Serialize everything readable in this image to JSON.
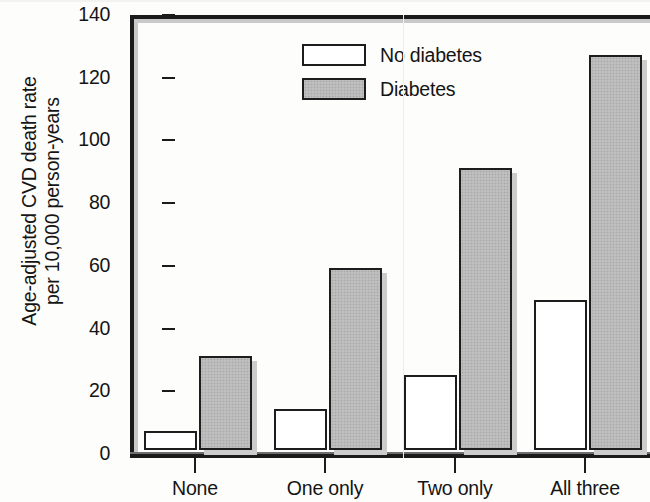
{
  "chart_data": {
    "type": "bar",
    "title": "",
    "xlabel": "",
    "ylabel_line1": "Age-adjusted CVD death rate",
    "ylabel_line2": "per 10,000 person-years",
    "categories": [
      "None",
      "One only",
      "Two only",
      "All three"
    ],
    "series": [
      {
        "name": "No diabetes",
        "values": [
          6,
          13,
          24,
          48
        ],
        "style": "open-white"
      },
      {
        "name": "Diabetes",
        "values": [
          30,
          58,
          90,
          126
        ],
        "style": "gray-stippled"
      }
    ],
    "ylim": [
      0,
      140
    ],
    "ytick_labels": [
      "0",
      "20",
      "40",
      "60",
      "80",
      "100",
      "120",
      "140"
    ],
    "ytick_values": [
      0,
      20,
      40,
      60,
      80,
      100,
      120,
      140
    ],
    "grid": false,
    "legend_position": "top-left-inside",
    "colors": {
      "no_diabetes_fill": "#ffffff",
      "diabetes_fill": "#b9b9b9",
      "outline": "#1d1d1d",
      "shadow": "#cccccc",
      "text": "#141414"
    }
  },
  "legend": {
    "entries": [
      {
        "label": "No diabetes",
        "swatch": "open-swatch"
      },
      {
        "label": "Diabetes",
        "swatch": "filled-swatch"
      }
    ]
  }
}
